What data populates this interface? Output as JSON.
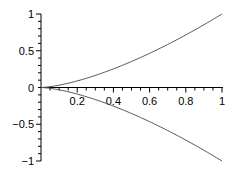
{
  "chart_data": {
    "type": "line",
    "title": "",
    "xlabel": "",
    "ylabel": "",
    "xlim": [
      0,
      1
    ],
    "ylim": [
      -1,
      1
    ],
    "grid": false,
    "legend": null,
    "x_ticks": [
      "0.2",
      "0.4",
      "0.6",
      "0.8",
      "1"
    ],
    "y_ticks": [
      "1",
      "0.5",
      "0",
      "-0.5",
      "-1"
    ],
    "x": [
      0,
      0.1,
      0.2,
      0.3,
      0.4,
      0.5,
      0.6,
      0.7,
      0.8,
      0.9,
      1.0
    ],
    "series": [
      {
        "name": "upper",
        "values": [
          0,
          0.032,
          0.089,
          0.164,
          0.253,
          0.354,
          0.465,
          0.586,
          0.716,
          0.854,
          1.0
        ]
      },
      {
        "name": "lower",
        "values": [
          0,
          -0.032,
          -0.089,
          -0.164,
          -0.253,
          -0.354,
          -0.465,
          -0.586,
          -0.716,
          -0.854,
          -1.0
        ]
      }
    ],
    "line_color": "#555555",
    "axis_color": "#000000"
  }
}
